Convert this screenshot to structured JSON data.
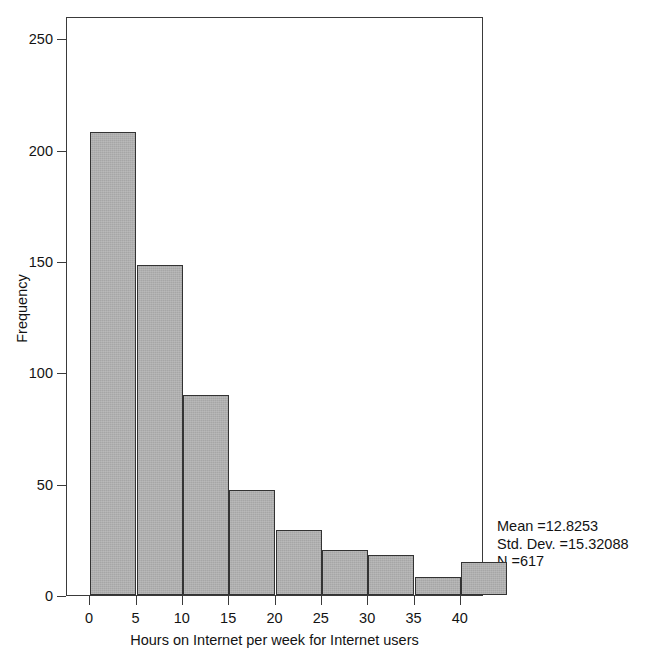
{
  "chart_data": {
    "type": "bar",
    "subtype": "histogram",
    "title": "",
    "xlabel": "Hours on Internet per week for Internet users",
    "ylabel": "Frequency",
    "xlim": [
      -2.5,
      42.5
    ],
    "ylim": [
      0,
      260
    ],
    "grid": false,
    "legend": null,
    "bin_width": 5,
    "bin_edges": [
      0,
      5,
      10,
      15,
      20,
      25,
      30,
      35,
      40,
      45
    ],
    "categories": [
      "0-5",
      "5-10",
      "10-15",
      "15-20",
      "20-25",
      "25-30",
      "30-35",
      "35-40",
      "40-45"
    ],
    "values": [
      208,
      148,
      90,
      47,
      29,
      20,
      18,
      8,
      15
    ],
    "bar_color": "#a6a6a6",
    "bar_edge_color": "#333333",
    "xticks": [
      0,
      5,
      10,
      15,
      20,
      25,
      30,
      35,
      40
    ],
    "xtick_labels": [
      "0",
      "5",
      "10",
      "15",
      "20",
      "25",
      "30",
      "35",
      "40"
    ],
    "yticks": [
      0,
      50,
      100,
      150,
      200,
      250
    ],
    "ytick_labels": [
      "0",
      "50",
      "100",
      "150",
      "200",
      "250"
    ],
    "annotations": {
      "mean": "Mean =12.8253",
      "std_dev": "Std. Dev. =15.32088",
      "n": "N =617"
    }
  }
}
